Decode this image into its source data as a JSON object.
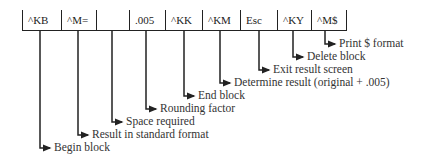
{
  "diagram": {
    "cells": [
      {
        "text": "^KB",
        "width": 39
      },
      {
        "text": "^M=",
        "width": 35
      },
      {
        "text": "",
        "width": 33
      },
      {
        "text": ".005",
        "width": 36
      },
      {
        "text": "^KK",
        "width": 37
      },
      {
        "text": "^KM",
        "width": 38
      },
      {
        "text": "Esc",
        "width": 37
      },
      {
        "text": "^KY",
        "width": 34
      },
      {
        "text": "^M$",
        "width": 36
      }
    ],
    "annotations": [
      {
        "label": "Begin block",
        "x": 40,
        "y": 148
      },
      {
        "label": "Result in standard format",
        "x": 78,
        "y": 135
      },
      {
        "label": "Space required",
        "x": 112,
        "y": 122
      },
      {
        "label": "Rounding factor",
        "x": 146,
        "y": 109
      },
      {
        "label": "End block",
        "x": 184,
        "y": 96
      },
      {
        "label": "Determine result (original + .005)",
        "x": 220,
        "y": 83
      },
      {
        "label": "Exit result screen",
        "x": 259,
        "y": 70
      },
      {
        "label": "Delete block",
        "x": 293,
        "y": 57
      },
      {
        "label": "Print $ format",
        "x": 325,
        "y": 44
      }
    ]
  }
}
